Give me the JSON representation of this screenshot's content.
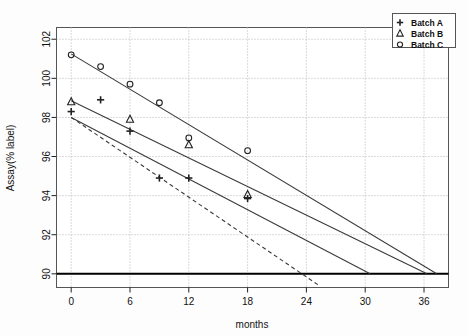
{
  "chart_data": {
    "type": "scatter",
    "title": "",
    "xlabel": "months",
    "ylabel": "Assay(% label)",
    "xlim": [
      -1.5,
      38.5
    ],
    "ylim": [
      89.3,
      102.6
    ],
    "xticks": [
      0,
      6,
      12,
      18,
      24,
      30,
      36
    ],
    "xtick_labels": [
      "0",
      "6",
      "12",
      "18",
      "24",
      "30",
      "36"
    ],
    "yticks": [
      90,
      92,
      94,
      96,
      98,
      100,
      102
    ],
    "ytick_labels": [
      "90",
      "92",
      "94",
      "96",
      "98",
      "100",
      "102"
    ],
    "grid": true,
    "grid_style": "dotted",
    "legend_position": "top-right",
    "specification_limit": 90,
    "series": [
      {
        "name": "Batch A",
        "marker": "plus",
        "points": [
          {
            "x": 0,
            "y": 98.3
          },
          {
            "x": 3,
            "y": 98.9
          },
          {
            "x": 6,
            "y": 97.3
          },
          {
            "x": 9,
            "y": 94.9
          },
          {
            "x": 12,
            "y": 94.9
          },
          {
            "x": 18,
            "y": 93.85
          }
        ],
        "fit_line": {
          "x0": 0,
          "y0": 98.0,
          "x1": 30.5,
          "y1": 90.0,
          "style": "solid"
        }
      },
      {
        "name": "Batch B",
        "marker": "triangle",
        "points": [
          {
            "x": 0,
            "y": 98.8
          },
          {
            "x": 6,
            "y": 97.9
          },
          {
            "x": 12,
            "y": 96.6
          },
          {
            "x": 18,
            "y": 94.05
          }
        ],
        "fit_line": {
          "x0": 0,
          "y0": 98.85,
          "x1": 36.3,
          "y1": 90.0,
          "style": "solid"
        }
      },
      {
        "name": "Batch C",
        "marker": "circle",
        "points": [
          {
            "x": 0,
            "y": 101.2
          },
          {
            "x": 3,
            "y": 100.6
          },
          {
            "x": 6,
            "y": 99.7
          },
          {
            "x": 9,
            "y": 98.75
          },
          {
            "x": 12,
            "y": 96.95
          },
          {
            "x": 18,
            "y": 96.3
          }
        ],
        "fit_line": {
          "x0": 0,
          "y0": 101.25,
          "x1": 37.3,
          "y1": 90.0,
          "style": "solid"
        }
      },
      {
        "name": "lower-confidence-bound",
        "marker": "none",
        "points": [],
        "fit_line": {
          "x0": 0,
          "y0": 98.0,
          "x1": 25.3,
          "y1": 89.4,
          "style": "dashed"
        }
      }
    ],
    "legend": [
      {
        "label": "Batch A",
        "marker": "plus"
      },
      {
        "label": "Batch B",
        "marker": "triangle"
      },
      {
        "label": "Batch C",
        "marker": "circle"
      }
    ],
    "colors": {
      "line": "#3a3a3a",
      "marker": "#222222",
      "grid": "#b5b5b5",
      "frame": "#555555",
      "spec_line": "#000000",
      "background": "#fdfdfd"
    }
  }
}
